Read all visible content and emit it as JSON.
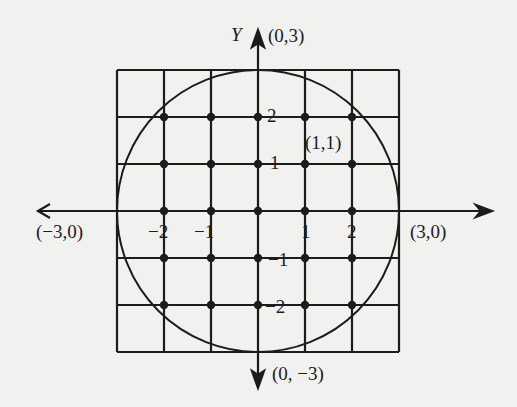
{
  "diagram": {
    "axis_label_y": "Y",
    "colors": {
      "ink": "#1c1c1c",
      "paper": "#f1f1ef"
    },
    "grid": {
      "min": -3,
      "max": 3,
      "step": 1
    },
    "circle": {
      "center": [
        0,
        0
      ],
      "radius": 3
    },
    "points": [
      [
        -2,
        2
      ],
      [
        -1,
        2
      ],
      [
        0,
        2
      ],
      [
        1,
        2
      ],
      [
        2,
        2
      ],
      [
        -2,
        1
      ],
      [
        -1,
        1
      ],
      [
        0,
        1
      ],
      [
        1,
        1
      ],
      [
        2,
        1
      ],
      [
        -2,
        0
      ],
      [
        -1,
        0
      ],
      [
        0,
        0
      ],
      [
        1,
        0
      ],
      [
        2,
        0
      ],
      [
        -2,
        -1
      ],
      [
        -1,
        -1
      ],
      [
        0,
        -1
      ],
      [
        1,
        -1
      ],
      [
        2,
        -1
      ],
      [
        -2,
        -2
      ],
      [
        -1,
        -2
      ],
      [
        0,
        -2
      ],
      [
        1,
        -2
      ],
      [
        2,
        -2
      ]
    ],
    "labels": {
      "top": "(0,3)",
      "bottom": "(0, −3)",
      "left": "(−3,0)",
      "right": "(3,0)",
      "point_1_1": "(1,1)",
      "x_ticks": {
        "m2": "−2",
        "m1": "−1",
        "p1": "1",
        "p2": "2"
      },
      "y_ticks": {
        "p2": "2",
        "p1": "1",
        "m1": "−1",
        "m2": "−2"
      }
    }
  }
}
